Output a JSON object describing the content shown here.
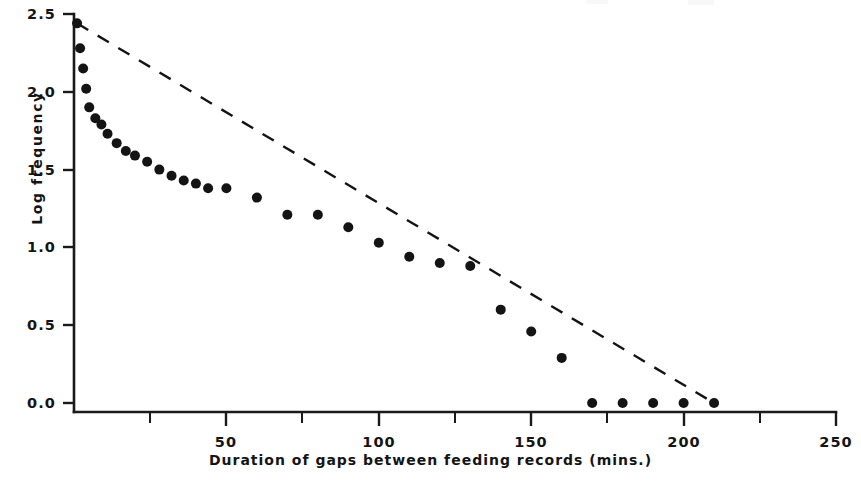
{
  "figure": {
    "background_color": "#ffffff",
    "ink_color": "#141414"
  },
  "axes": {
    "y_label": "Log frequency",
    "x_label": "Duration of gaps between feeding records (mins.)",
    "y_ticks": [
      "0.0",
      "0.5",
      "1.0",
      "1.5",
      "2.0",
      "2.5"
    ],
    "x_ticks": [
      "50",
      "100",
      "150",
      "200",
      "250"
    ]
  },
  "chart_data": {
    "type": "scatter",
    "title": "",
    "subtitle": "",
    "xlabel": "Duration of gaps between feeding records (mins.)",
    "ylabel": "Log frequency",
    "xlim": [
      0,
      250
    ],
    "ylim": [
      0.0,
      2.5
    ],
    "xticks": [
      50,
      100,
      150,
      200,
      250
    ],
    "xminorticks": [
      25,
      75,
      125,
      175,
      225
    ],
    "yticks": [
      0.0,
      0.5,
      1.0,
      1.5,
      2.0,
      2.5
    ],
    "grid": false,
    "legend": false,
    "series": [
      {
        "name": "Observed log frequency",
        "type": "scatter",
        "marker": "filled-circle",
        "color": "#141414",
        "x": [
          1,
          2,
          3,
          4,
          5,
          7,
          9,
          11,
          14,
          17,
          20,
          24,
          28,
          32,
          36,
          40,
          44,
          50,
          60,
          70,
          80,
          90,
          100,
          110,
          120,
          130,
          140,
          150,
          160,
          170,
          180,
          190,
          200,
          210
        ],
        "y": [
          2.44,
          2.28,
          2.15,
          2.02,
          1.9,
          1.83,
          1.79,
          1.73,
          1.67,
          1.62,
          1.59,
          1.55,
          1.5,
          1.46,
          1.43,
          1.41,
          1.38,
          1.38,
          1.32,
          1.21,
          1.21,
          1.13,
          1.03,
          0.94,
          0.9,
          0.88,
          0.6,
          0.46,
          0.29,
          0.0,
          0.0,
          0.0,
          0.0,
          0.0
        ]
      },
      {
        "name": "Fitted exponential line",
        "type": "line",
        "style": "dashed",
        "color": "#141414",
        "x": [
          1,
          210
        ],
        "y": [
          2.44,
          0.0
        ]
      }
    ]
  }
}
